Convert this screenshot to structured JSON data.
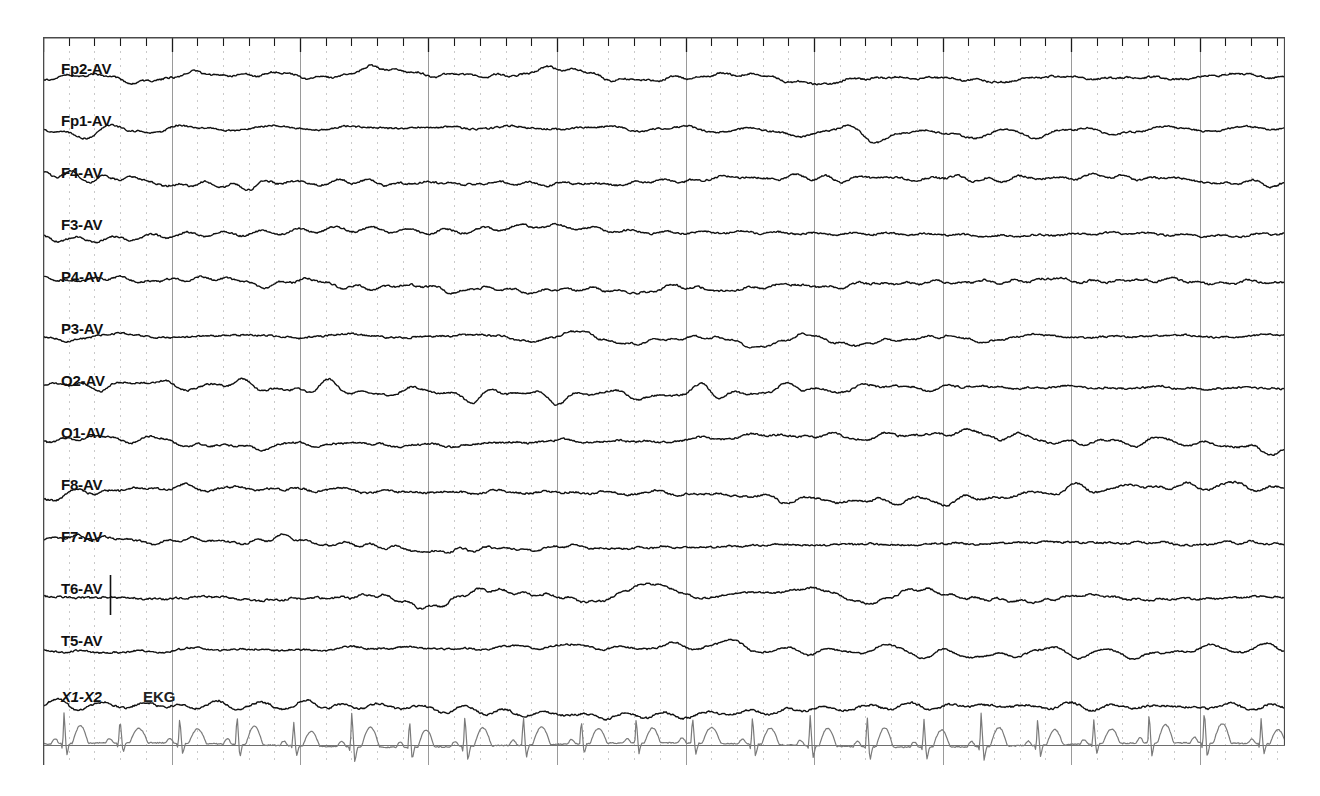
{
  "recording": {
    "type": "eeg-strip-chart",
    "montage": "Average reference (AV)",
    "channel_count": 13,
    "display_width_px": 1242,
    "display_height_px": 728
  },
  "channels": [
    {
      "label": "Fp2-AV",
      "label_x": 18,
      "label_y": 24,
      "baseline_y": 40,
      "amplitude": 17,
      "seed": 11,
      "style": "eeg"
    },
    {
      "label": "Fp1-AV",
      "label_x": 18,
      "label_y": 76,
      "baseline_y": 92,
      "amplitude": 16,
      "seed": 23,
      "style": "eeg"
    },
    {
      "label": "F4-AV",
      "label_x": 18,
      "label_y": 128,
      "baseline_y": 144,
      "amplitude": 18,
      "seed": 37,
      "style": "eeg"
    },
    {
      "label": "F3-AV",
      "label_x": 18,
      "label_y": 180,
      "baseline_y": 196,
      "amplitude": 17,
      "seed": 49,
      "style": "eeg"
    },
    {
      "label": "P4-AV",
      "label_x": 18,
      "label_y": 232,
      "baseline_y": 248,
      "amplitude": 18,
      "seed": 61,
      "style": "eeg"
    },
    {
      "label": "P3-AV",
      "label_x": 18,
      "label_y": 284,
      "baseline_y": 300,
      "amplitude": 16,
      "seed": 73,
      "style": "eeg"
    },
    {
      "label": "O2-AV",
      "label_x": 18,
      "label_y": 336,
      "baseline_y": 352,
      "amplitude": 17,
      "seed": 89,
      "style": "eeg"
    },
    {
      "label": "O1-AV",
      "label_x": 18,
      "label_y": 388,
      "baseline_y": 404,
      "amplitude": 18,
      "seed": 101,
      "style": "eeg"
    },
    {
      "label": "F8-AV",
      "label_x": 18,
      "label_y": 440,
      "baseline_y": 456,
      "amplitude": 19,
      "seed": 113,
      "style": "eeg"
    },
    {
      "label": "F7-AV",
      "label_x": 18,
      "label_y": 492,
      "baseline_y": 508,
      "amplitude": 17,
      "seed": 127,
      "style": "eeg"
    },
    {
      "label": "T6-AV",
      "label_x": 18,
      "label_y": 544,
      "baseline_y": 560,
      "amplitude": 18,
      "seed": 139,
      "style": "eeg"
    },
    {
      "label": "T5-AV",
      "label_x": 18,
      "label_y": 596,
      "baseline_y": 612,
      "amplitude": 16,
      "seed": 151,
      "style": "eeg"
    },
    {
      "label": "X1-X2",
      "label_x": 18,
      "label_y": 652,
      "baseline_y": 672,
      "amplitude": 20,
      "seed": 167,
      "style": "ekg",
      "italic": true
    }
  ],
  "ekg": {
    "annotation": "EKG",
    "annotation_x": 100,
    "annotation_y": 652,
    "baseline_y": 708,
    "beat_interval_px": 57,
    "beat_count": 22,
    "r_amplitude": 30,
    "color": "#7a7a7a"
  },
  "grid": {
    "dotted_spacing_px": 25.7,
    "solid_every_n": 5,
    "dotted_color": "#c9c9c9",
    "solid_color": "#9a9a9a",
    "frame_color": "#4a4a4a",
    "baseline_rule_y": 708,
    "bottom_extent_y": 728
  },
  "ruler": {
    "tick_spacing_px": 25.7,
    "minor_tick_height": 9,
    "major_tick_height": 15,
    "major_every_n": 5,
    "color": "#1a1a1a"
  },
  "calibration_marker": {
    "x": 67,
    "y_top": 538,
    "y_bottom": 578,
    "color": "#111111"
  },
  "trace_style": {
    "eeg_color": "#101010",
    "eeg_width": 1.4,
    "ekg_width": 1.2
  }
}
